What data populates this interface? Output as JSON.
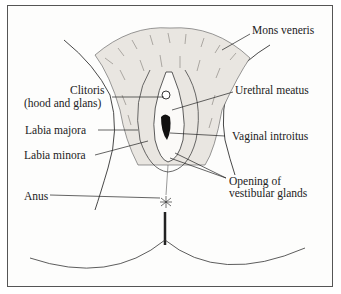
{
  "diagram": {
    "type": "anatomical-illustration",
    "labels": {
      "mons_veneris": "Mons veneris",
      "clitoris_line1": "Clitoris",
      "clitoris_line2": "(hood and glans)",
      "urethral_meatus": "Urethral meatus",
      "labia_majora": "Labia majora",
      "vaginal_introitus": "Vaginal introitus",
      "labia_minora": "Labia minora",
      "opening_line1": "Opening of",
      "opening_line2": "vestibular glands",
      "anus": "Anus"
    }
  }
}
